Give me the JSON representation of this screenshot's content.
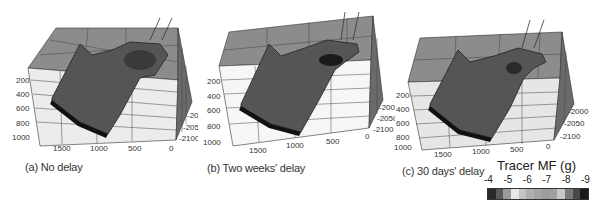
{
  "chart_data": [
    {
      "type": "surface3d",
      "title": "(a) No delay",
      "x_ticks": [
        "1500",
        "1000",
        "500",
        "0"
      ],
      "y_ticks": [
        "200",
        "400",
        "600",
        "800",
        "1000"
      ],
      "z_ticks": [
        "-2000",
        "-2050",
        "-2100"
      ],
      "grid": true
    },
    {
      "type": "surface3d",
      "title": "(b) Two weeks' delay",
      "x_ticks": [
        "1500",
        "1000",
        "500",
        "0"
      ],
      "y_ticks": [
        "200",
        "400",
        "600",
        "800",
        "1000"
      ],
      "z_ticks": [
        "-2000",
        "-2050",
        "-2100"
      ],
      "grid": true
    },
    {
      "type": "surface3d",
      "title": "(c) 30 days' delay",
      "x_ticks": [
        "1500",
        "1000",
        "500",
        "0"
      ],
      "y_ticks": [
        "200",
        "400",
        "600",
        "800",
        "1000"
      ],
      "z_ticks": [
        "-2000",
        "-2050",
        "-2100"
      ],
      "grid": true
    }
  ],
  "panels": [
    {
      "caption": "(a) No delay"
    },
    {
      "caption": "(b) Two weeks' delay"
    },
    {
      "caption": "(c) 30 days' delay"
    }
  ],
  "axes": {
    "x_ticks": [
      "1500",
      "1000",
      "500",
      "0"
    ],
    "y_ticks": [
      "200",
      "400",
      "600",
      "800",
      "1000"
    ],
    "z_ticks": [
      "-2000",
      "-2050",
      "-2100"
    ]
  },
  "colorbar": {
    "title": "Tracer MF (g)",
    "labels": [
      "-4",
      "-5",
      "-6",
      "-7",
      "-8",
      "-9"
    ],
    "swatches": [
      "#2a2a2a",
      "#5a5a5a",
      "#9a9a9a",
      "#e8e8e8",
      "#c4c4c4",
      "#b0b0b0",
      "#a4a4a4",
      "#9c9c9c",
      "#a0a0a0",
      "#c8c8c8",
      "#7a7a7a",
      "#4a4a4a",
      "#1a1a1a"
    ]
  }
}
